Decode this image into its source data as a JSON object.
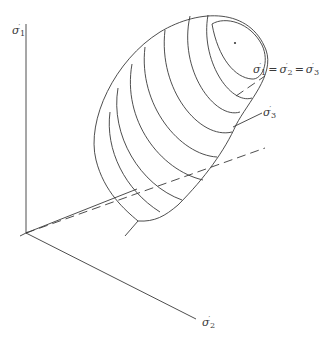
{
  "figure": {
    "type": "yield-surface-diagram",
    "axes": [
      {
        "id": "sigma1",
        "symbol": "σ",
        "subscript": "1",
        "prime": "′",
        "direction": "vertical"
      },
      {
        "id": "sigma2",
        "symbol": "σ",
        "subscript": "2",
        "prime": "′",
        "direction": "lower-right"
      },
      {
        "id": "sigma3",
        "symbol": "σ",
        "subscript": "3",
        "prime": "′",
        "direction": "upper-right"
      }
    ],
    "hydrostatic_axis_label": {
      "parts": [
        {
          "symbol": "σ",
          "subscript": "1",
          "prime": "′"
        },
        {
          "symbol": "σ",
          "subscript": "2",
          "prime": "′"
        },
        {
          "symbol": "σ",
          "subscript": "3",
          "prime": "′"
        }
      ],
      "operator": "="
    },
    "contour_count": 8,
    "colors": {
      "line": "#3a3a3a",
      "background": "#ffffff"
    }
  }
}
